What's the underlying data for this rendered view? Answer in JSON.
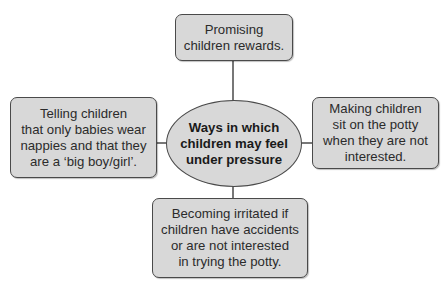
{
  "diagram": {
    "type": "spider-diagram",
    "center": {
      "text": "Ways in which\nchildren may feel\nunder pressure"
    },
    "branches": [
      {
        "position": "top",
        "text": "Promising\nchildren rewards."
      },
      {
        "position": "left",
        "text": "Telling children\nthat only babies wear\nnappies and that they\nare a ‘big boy/girl’."
      },
      {
        "position": "right",
        "text": "Making children\nsit on the potty\nwhen they are not\ninterested."
      },
      {
        "position": "bottom",
        "text": "Becoming irritated if\nchildren have accidents\nor are not interested\nin trying the potty."
      }
    ],
    "colors": {
      "fill": "#d8d8d8",
      "stroke": "#4a4a4a",
      "text": "#2b2b2b"
    }
  }
}
